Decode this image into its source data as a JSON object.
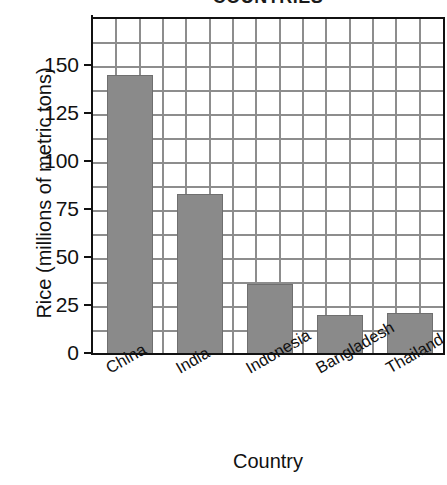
{
  "chart_data": {
    "type": "bar",
    "title_visible_fragment": "COUNTRIES",
    "categories": [
      "China",
      "India",
      "Indonesia",
      "Bangladesh",
      "Thailand"
    ],
    "values": [
      146,
      84,
      37,
      21,
      22
    ],
    "xlabel": "Country",
    "ylabel": "Rice (millions of metric tons)",
    "ylim": [
      0,
      175
    ],
    "yticks": [
      0,
      25,
      50,
      75,
      100,
      125,
      150
    ],
    "ytick_labels": [
      "0",
      "25",
      "50",
      "75",
      "100",
      "125",
      "150"
    ],
    "grid": true,
    "grid_minor": true,
    "legend": "none",
    "bar_color": "#8a8a8a",
    "bar_edge_color": "#6f6f6f",
    "grid_color": "#8d8d8d",
    "axis_color": "#111111",
    "background": "#ffffff"
  },
  "axes": {
    "x_title": "Country",
    "y_title": "Rice (millions of metric tons)"
  }
}
